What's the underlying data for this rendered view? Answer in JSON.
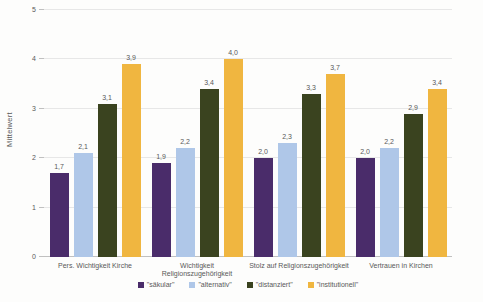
{
  "chart": {
    "background": "#fdfdfc",
    "text_color": "#595959",
    "gridline_color": "#e7e7e7",
    "axis_line_color": "#c0c0c0"
  },
  "chart_data": {
    "type": "bar",
    "ylabel": "Mittelwert",
    "ylim": [
      0,
      5
    ],
    "yticks": [
      0,
      1,
      2,
      3,
      4,
      5
    ],
    "grid": true,
    "legend_position": "bottom",
    "categories": [
      "Pers. Wichtigkeit Kirche",
      "Wichtigkeit Religionszugehörigkeit",
      "Stolz auf Religionszugehörigkeit",
      "Vertrauen in Kirchen"
    ],
    "series": [
      {
        "name": "\"säkular\"",
        "color": "#4A2C6A",
        "values": [
          1.7,
          1.9,
          2.0,
          2.0
        ],
        "labels": [
          "1,7",
          "1,9",
          "2,0",
          "2,0"
        ]
      },
      {
        "name": "\"alternativ\"",
        "color": "#AFC7E8",
        "values": [
          2.1,
          2.2,
          2.3,
          2.2
        ],
        "labels": [
          "2,1",
          "2,2",
          "2,3",
          "2,2"
        ]
      },
      {
        "name": "\"distanziert\"",
        "color": "#3A431F",
        "values": [
          3.1,
          3.4,
          3.3,
          2.9
        ],
        "labels": [
          "3,1",
          "3,4",
          "3,3",
          "2,9"
        ]
      },
      {
        "name": "\"institutionell\"",
        "color": "#F0B640",
        "values": [
          3.9,
          4.0,
          3.7,
          3.4
        ],
        "labels": [
          "3,9",
          "4,0",
          "3,7",
          "3,4"
        ]
      }
    ]
  }
}
